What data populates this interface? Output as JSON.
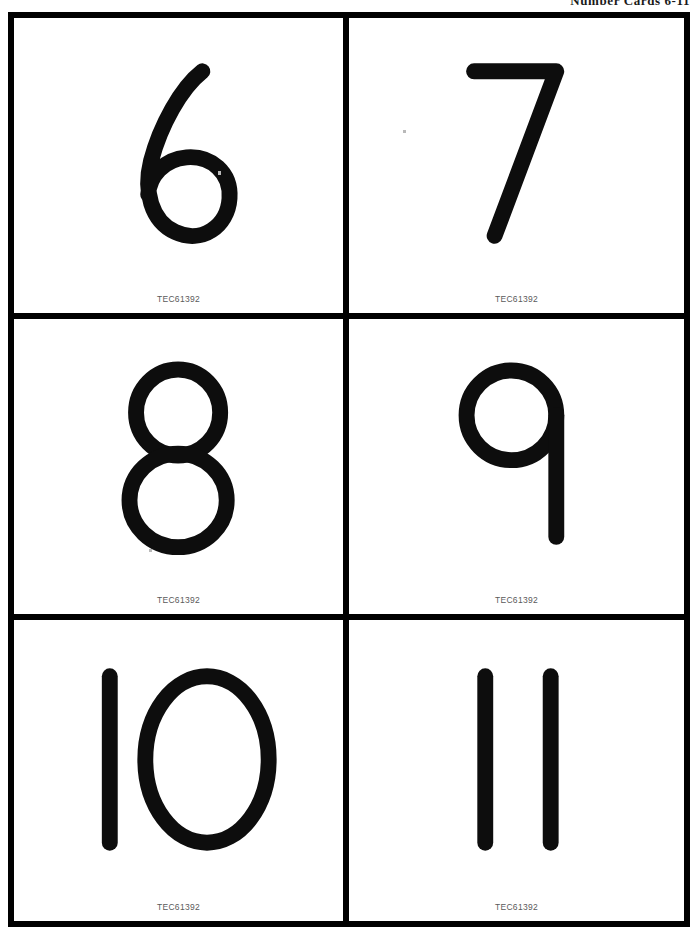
{
  "page": {
    "header_title": "Number Cards 6-11",
    "background_color": "#ffffff",
    "ink_color": "#0d0d0d",
    "border_color": "#000000",
    "code_color": "#5a5a5a"
  },
  "cards": [
    {
      "number": "6",
      "code": "TEC61392",
      "glyph": "six"
    },
    {
      "number": "7",
      "code": "TEC61392",
      "glyph": "seven"
    },
    {
      "number": "8",
      "code": "TEC61392",
      "glyph": "eight"
    },
    {
      "number": "9",
      "code": "TEC61392",
      "glyph": "nine"
    },
    {
      "number": "10",
      "code": "TEC61392",
      "glyph": "ten"
    },
    {
      "number": "11",
      "code": "TEC61392",
      "glyph": "eleven"
    }
  ],
  "layout": {
    "columns": 2,
    "rows": 3,
    "total_cards": 6
  }
}
